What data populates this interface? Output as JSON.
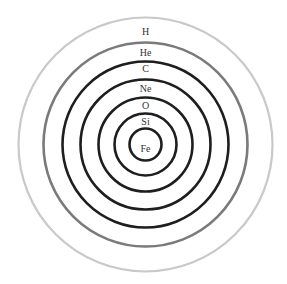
{
  "diagram": {
    "title": "",
    "center": {
      "x": 145.5,
      "y": 144.5
    },
    "layers": [
      {
        "label": "H",
        "radius": 127,
        "stroke": "#c9c9c9",
        "width": 2.2,
        "label_y": 31
      },
      {
        "label": "He",
        "radius": 102,
        "stroke": "#7a7a7a",
        "width": 2.6,
        "label_y": 52
      },
      {
        "label": "C",
        "radius": 83,
        "stroke": "#1e1e1e",
        "width": 2.6,
        "label_y": 68
      },
      {
        "label": "Ne",
        "radius": 65,
        "stroke": "#1e1e1e",
        "width": 2.6,
        "label_y": 88
      },
      {
        "label": "O",
        "radius": 47,
        "stroke": "#1e1e1e",
        "width": 2.6,
        "label_y": 105
      },
      {
        "label": "Si",
        "radius": 31,
        "stroke": "#1e1e1e",
        "width": 2.6,
        "label_y": 121
      },
      {
        "label": "Fe",
        "radius": 16,
        "stroke": "#1e1e1e",
        "width": 2.6,
        "label_y": 148
      }
    ]
  }
}
